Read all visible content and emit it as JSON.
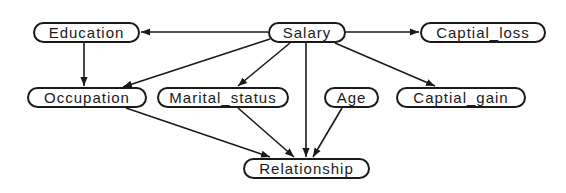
{
  "diagram": {
    "type": "directed-graph",
    "colors": {
      "stroke": "#1a1a1a",
      "fill": "#ffffff",
      "text": "#1a1a1a"
    },
    "nodes": [
      {
        "id": "education",
        "label": "Education",
        "x": 33,
        "y": 22,
        "w": 107
      },
      {
        "id": "salary",
        "label": "Salary",
        "x": 268,
        "y": 22,
        "w": 78
      },
      {
        "id": "captial_loss",
        "label": "Captial_loss",
        "x": 420,
        "y": 22,
        "w": 126
      },
      {
        "id": "occupation",
        "label": "Occupation",
        "x": 27,
        "y": 87,
        "w": 120
      },
      {
        "id": "marital_status",
        "label": "Marital_status",
        "x": 157,
        "y": 87,
        "w": 132
      },
      {
        "id": "age",
        "label": "Age",
        "x": 324,
        "y": 87,
        "w": 55
      },
      {
        "id": "captial_gain",
        "label": "Captial_gain",
        "x": 396,
        "y": 87,
        "w": 130
      },
      {
        "id": "relationship",
        "label": "Relationship",
        "x": 243,
        "y": 158,
        "w": 127
      }
    ],
    "edges": [
      {
        "from": "salary",
        "to": "education"
      },
      {
        "from": "salary",
        "to": "captial_loss"
      },
      {
        "from": "salary",
        "to": "occupation"
      },
      {
        "from": "salary",
        "to": "marital_status"
      },
      {
        "from": "salary",
        "to": "captial_gain"
      },
      {
        "from": "salary",
        "to": "relationship"
      },
      {
        "from": "education",
        "to": "occupation"
      },
      {
        "from": "occupation",
        "to": "relationship"
      },
      {
        "from": "marital_status",
        "to": "relationship"
      },
      {
        "from": "age",
        "to": "relationship"
      }
    ]
  }
}
